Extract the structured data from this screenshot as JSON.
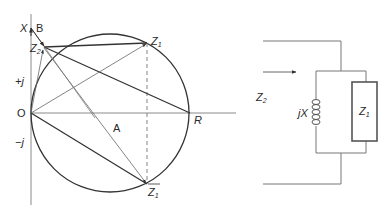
{
  "diagram": {
    "type": "impedance circle diagram with parallel circuit",
    "left_panel": {
      "axes": {
        "vertical_label": "X",
        "horizontal_label": "R",
        "origin_label": "O",
        "positive_label": "+j",
        "negative_label": "−j"
      },
      "points": {
        "B": "B",
        "A": "A",
        "Z2": "Z",
        "Z2_sub": "2",
        "Z1": "Z",
        "Z1_sub": "1",
        "Z1_conj": "Z",
        "Z1_conj_sub": "1"
      }
    },
    "right_panel": {
      "input_label": "Z",
      "input_sub": "2",
      "inductor_label": "jX",
      "load_label": "Z",
      "load_sub": "1"
    },
    "colors": {
      "line": "#333333",
      "thin_line": "#666666",
      "axis": "#888888",
      "background": "#ffffff"
    }
  }
}
